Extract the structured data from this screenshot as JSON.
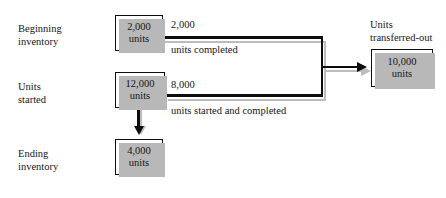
{
  "diagram": {
    "clipped_top_text": "",
    "row_labels": [
      {
        "id": "beginning-inventory",
        "line1": "Beginning",
        "line2": "inventory"
      },
      {
        "id": "units-started",
        "line1": "Units",
        "line2": "started"
      },
      {
        "id": "ending-inventory",
        "line1": "Ending",
        "line2": "inventory"
      }
    ],
    "nodes": [
      {
        "id": "beginning-inventory-node",
        "value": "2,000",
        "unit": "units"
      },
      {
        "id": "units-started-node",
        "value": "12,000",
        "unit": "units"
      },
      {
        "id": "ending-inventory-node",
        "value": "4,000",
        "unit": "units"
      },
      {
        "id": "units-transferred-out-node",
        "value": "10,000",
        "unit": "units"
      }
    ],
    "captions": [
      {
        "id": "units-transferred-out-caption",
        "line1": "Units",
        "line2": "transferred-out"
      }
    ],
    "edges": [
      {
        "id": "units-completed-edge",
        "amount": "2,000",
        "description": "units completed"
      },
      {
        "id": "units-started-and-completed-edge",
        "amount": "8,000",
        "description": "units started and completed"
      }
    ],
    "colors": {
      "line": "#0d0d0d",
      "shadow": "#bcbcbc",
      "text": "#161616",
      "background": "#ffffff"
    }
  }
}
